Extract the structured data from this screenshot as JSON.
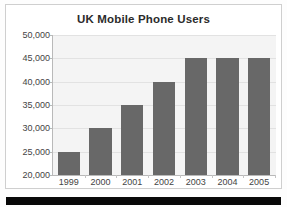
{
  "chart_data": {
    "type": "bar",
    "title": "UK Mobile Phone Users",
    "xlabel": "",
    "ylabel": "",
    "categories": [
      "1999",
      "2000",
      "2001",
      "2002",
      "2003",
      "2004",
      "2005"
    ],
    "values": [
      25000,
      30000,
      35000,
      40000,
      45000,
      45000,
      45000
    ],
    "ylim": [
      20000,
      50000
    ],
    "ytick_values": [
      20000,
      25000,
      30000,
      35000,
      40000,
      45000,
      50000
    ],
    "ytick_labels": [
      "20,000",
      "25,000",
      "30,000",
      "35,000",
      "40,000",
      "45,000",
      "50,000"
    ],
    "grid": true,
    "legend": false,
    "legend_position": "none",
    "bar_color": "#686868",
    "plot_background": "#f4f4f4",
    "gridline_color": "#e2e2e2",
    "axis_color": "#b9b9b9",
    "title_color": "#2b2b2b",
    "tick_label_color": "#444444"
  },
  "page": {
    "panel_background": "#ffffff",
    "panel_border_color": "#cfcfcf",
    "band_color": "#080808"
  }
}
